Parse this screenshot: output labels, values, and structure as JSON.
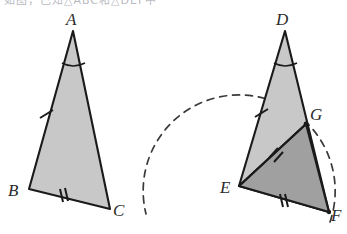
{
  "figure": {
    "title_strip": "如图，已知△ABC和△DEF中",
    "background_color": "#ffffff",
    "stroke_color": "#1a1a1a",
    "light_fill": "#c8c8c8",
    "dark_fill": "#a0a0a0",
    "label_color": "#2b2b2b",
    "dash_color": "#3a3a3a"
  },
  "left_triangle": {
    "name": "triangle-ABC",
    "fill": "#c8c8c8",
    "vertices": {
      "A": {
        "label": "A",
        "x": 73,
        "y": 31,
        "label_x": 66,
        "label_y": 25
      },
      "B": {
        "label": "B",
        "x": 29,
        "y": 189,
        "label_x": 8,
        "label_y": 196
      },
      "C": {
        "label": "C",
        "x": 110,
        "y": 209,
        "label_x": 113,
        "label_y": 216
      }
    },
    "marks": {
      "angle_arc_A": {
        "name": "angle-arc-A",
        "cx": 73,
        "cy": 31,
        "radius": 30
      },
      "tick_AB": {
        "name": "single-tick-AB",
        "count": 1,
        "x": 46,
        "y": 114
      },
      "tick_BC": {
        "name": "double-tick-BC",
        "count": 2,
        "x": 63,
        "y": 196
      }
    }
  },
  "right_figure": {
    "name": "figure-DEFG",
    "light_fill": "#c8c8c8",
    "dark_fill": "#a0a0a0",
    "vertices": {
      "D": {
        "label": "D",
        "x": 285,
        "y": 31,
        "label_x": 276,
        "label_y": 25
      },
      "E": {
        "label": "E",
        "x": 239,
        "y": 186,
        "label_x": 220,
        "label_y": 193
      },
      "F": {
        "label": "F",
        "x": 329,
        "y": 212,
        "label_x": 331,
        "label_y": 219
      },
      "G": {
        "label": "G",
        "x": 306,
        "y": 124,
        "label_x": 309,
        "label_y": 119
      }
    },
    "marks": {
      "angle_arc_D": {
        "name": "angle-arc-D",
        "cx": 285,
        "cy": 31,
        "radius": 30
      },
      "tick_DE": {
        "name": "single-tick-DE",
        "count": 1,
        "x": 261,
        "y": 113
      },
      "tick_EG": {
        "name": "double-tick-EG",
        "count": 2,
        "x": 274,
        "y": 152
      },
      "tick_EF": {
        "name": "double-tick-EF",
        "count": 2,
        "x": 283,
        "y": 200
      }
    },
    "dashed_arc": {
      "name": "construction-arc",
      "center_x": 239,
      "center_y": 186,
      "radius": 96,
      "dash_pattern": "7 6"
    }
  },
  "paths": {
    "triangle_abc": "M 73 31 L 29 189 L 110 209 Z",
    "triangle_def": "M 285 31 L 239 186 L 329 212 Z",
    "triangle_egf": "M 239 186 L 306 124 L 329 212 Z",
    "segment_eg": "M 239 186 L 306 124",
    "arc_dashed": "M 330 222 A 96 96 0 1 0 146 214"
  }
}
